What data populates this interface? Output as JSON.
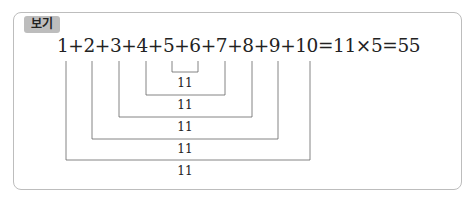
{
  "example": {
    "tag_label": "보기",
    "equation": "1+2+3+4+5+6+7+8+9+10=11×5=55",
    "pairs": [
      {
        "a": 5,
        "b": 6,
        "sum": "11"
      },
      {
        "a": 4,
        "b": 7,
        "sum": "11"
      },
      {
        "a": 3,
        "b": 8,
        "sum": "11"
      },
      {
        "a": 2,
        "b": 9,
        "sum": "11"
      },
      {
        "a": 1,
        "b": 10,
        "sum": "11"
      }
    ]
  }
}
